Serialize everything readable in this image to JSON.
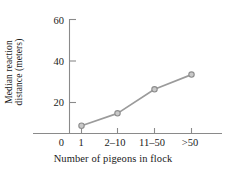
{
  "chart_data": {
    "type": "line",
    "title": "",
    "xlabel": "Number of pigeons in flock",
    "ylabel": "Median reaction distance (meters)",
    "ylabel_line1": "Median reaction",
    "ylabel_line2": "distance (meters)",
    "categories": [
      "1",
      "2–10",
      "11–50",
      ">50"
    ],
    "values": [
      5,
      13,
      28.5,
      38
    ],
    "origin_label": "0",
    "yticks": [
      0,
      20,
      40,
      60
    ],
    "ytick_labels": [
      "0",
      "20",
      "40",
      "60"
    ],
    "ylim": [
      0,
      66
    ],
    "xlim": [
      0,
      5
    ],
    "grid": false,
    "legend": null,
    "series": [
      {
        "name": "Median reaction distance",
        "values": [
          5,
          13,
          28.5,
          38
        ],
        "color": "#9b9b9b",
        "marker": "circle",
        "marker_face": "#c9c9c9"
      }
    ],
    "colors": {
      "line": "#9b9b9b",
      "marker_edge": "#8d8d8d",
      "marker_fill": "#cccccc",
      "axis": "#8a8a8a",
      "text": "#1a1a1a",
      "background": "#ffffff"
    }
  }
}
